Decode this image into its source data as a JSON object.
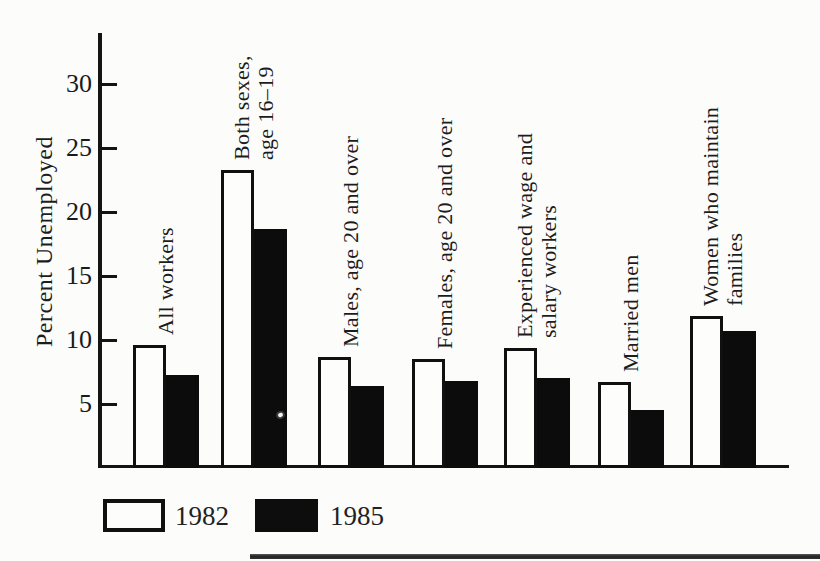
{
  "chart_data": {
    "type": "bar",
    "title": "",
    "xlabel": "",
    "ylabel": "Percent Unemployed",
    "ylim": [
      0,
      34
    ],
    "yticks": [
      5,
      10,
      15,
      20,
      25,
      30
    ],
    "grid": false,
    "legend_position": "bottom-left",
    "categories": [
      {
        "lines": [
          "All workers"
        ]
      },
      {
        "lines": [
          "Both sexes,",
          "age 16–19"
        ]
      },
      {
        "lines": [
          "Males, age 20 and over"
        ]
      },
      {
        "lines": [
          "Females, age 20 and over"
        ]
      },
      {
        "lines": [
          "Experienced wage and",
          "salary workers"
        ]
      },
      {
        "lines": [
          "Married men"
        ]
      },
      {
        "lines": [
          "Women who maintain",
          "families"
        ]
      }
    ],
    "series": [
      {
        "name": "1982",
        "swatch": "white",
        "values": [
          9.6,
          23.3,
          8.7,
          8.5,
          9.4,
          6.7,
          11.9
        ]
      },
      {
        "name": "1985",
        "swatch": "black",
        "values": [
          7.3,
          18.7,
          6.4,
          6.8,
          7.0,
          4.5,
          10.7
        ]
      }
    ]
  },
  "colors": {
    "ink": "#141414",
    "bar_black": "#0c0c0c",
    "bar_white": "#fdfdfc",
    "background": "#fcfcfa"
  },
  "artifacts": {
    "print_dot": "small white speck inside tall 1985 bar",
    "bottom_rule": "dark horizontal page rule at lower right"
  }
}
